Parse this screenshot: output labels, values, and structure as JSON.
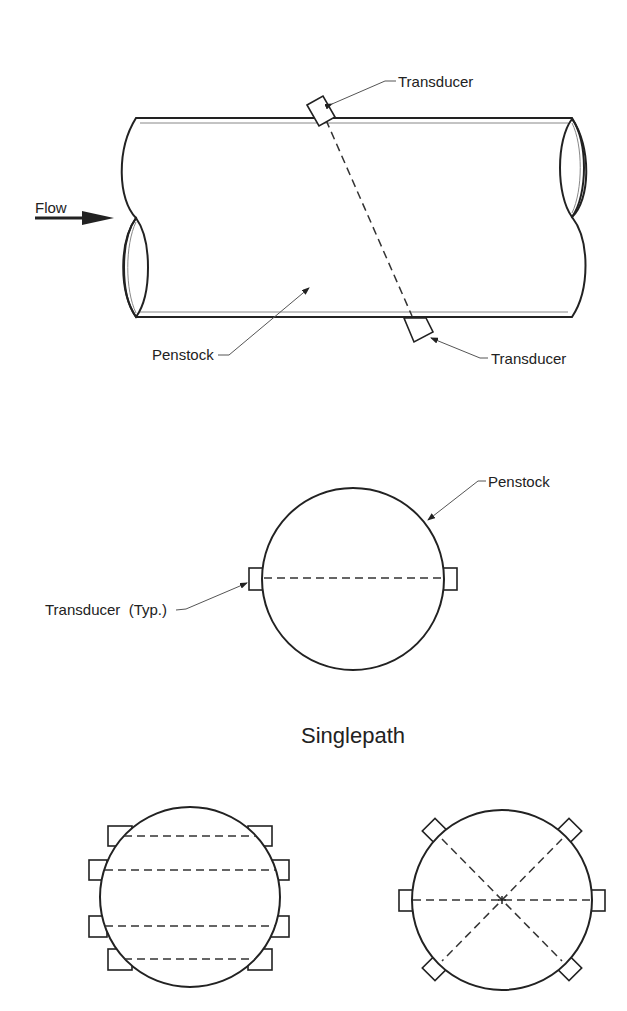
{
  "side_view": {
    "flow_label": "Flow",
    "top_transducer_label": "Transducer",
    "bottom_transducer_label": "Transducer",
    "penstock_label": "Penstock"
  },
  "singlepath_section": {
    "penstock_label": "Penstock",
    "transducer_label": "Transducer  (Typ.)",
    "caption": "Singlepath"
  },
  "multipath_sections": {
    "parallel_paths_count": 4,
    "crossed_paths_count": 3
  },
  "colors": {
    "line": "#222222",
    "leader": "#555555",
    "background": "#ffffff"
  }
}
